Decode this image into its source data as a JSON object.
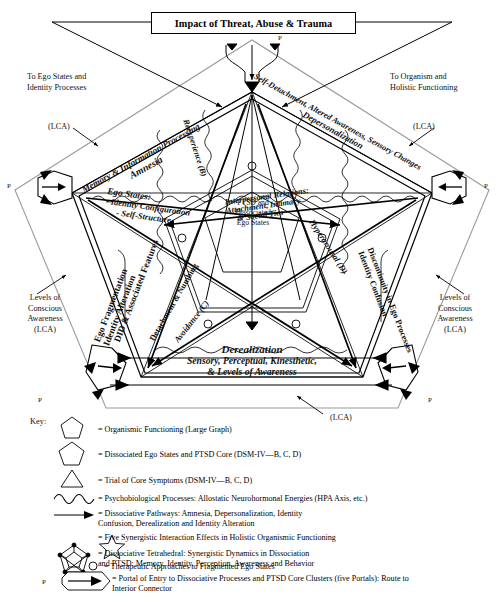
{
  "title": {
    "text": "Impact of Threat, Abuse & Trauma"
  },
  "annotations": {
    "left_top": "To Ego States and\nIdentity Processes",
    "right_top": "To Organism and\nHolistic Functioning",
    "lca_left_upper": "(LCA)",
    "lca_right_upper": "(LCA)",
    "lca_bottom": "(LCA)",
    "left_levels": "Levels of\nConscious\nAwareness\n(LCA)",
    "right_levels": "Levels of\nConscious\nAwareness\n(LCA)",
    "portal_letter": "P"
  },
  "center": {
    "line1": "PTSD and",
    "line2": "Dissociated",
    "line3": "Ego States"
  },
  "edges": [
    {
      "id": "upper-left",
      "line1": "Memory & Information Processing",
      "line2": "Amnesia"
    },
    {
      "id": "upper-right",
      "line1": "Self-Detachment, Altered Awareness, Sensory Changes",
      "line2": "Depersonalization"
    },
    {
      "id": "lower-left",
      "line1": "Ego Fragmentation",
      "line2": "Identity Alteration",
      "line3": "DID & Associated Features"
    },
    {
      "id": "lower-right",
      "line1": "Discontinuity in Ego Processes",
      "line2": "Identity Confusion"
    },
    {
      "id": "bottom",
      "line1": "Derealization",
      "line2": "Sensory, Perceptual, Kinesthetic,",
      "line3": "& Levels of Awareness"
    }
  ],
  "interior_labels": [
    {
      "id": "ego-states",
      "line1": "Ego States:",
      "line2": "- Identity Configuration",
      "line3": "- Self-Structure"
    },
    {
      "id": "interpersonal",
      "line1": "Interpersonal Relations:",
      "line2": "Attachment, Intimacy",
      "line3": "& Social Ties"
    }
  ],
  "spokes": [
    {
      "id": "reexperience",
      "label": "Reexperience (B)"
    },
    {
      "id": "detachment",
      "label": "Detachment & Numbing"
    },
    {
      "id": "avoidance",
      "label": "Avoidance (C)"
    },
    {
      "id": "hyperarousal",
      "label": "Hyperarousal (D)"
    }
  ],
  "key": {
    "label": "Key:",
    "items": [
      {
        "icon": "pentagon-small-icon",
        "text": "= Organismic Functioning (Large Graph)"
      },
      {
        "icon": "pentagon-icon",
        "text": "= Dissociated Ego States and PTSD Core (DSM-IV—B, C, D)"
      },
      {
        "icon": "triangle-icon",
        "text": "= Trial of Core Symptoms (DSM-IV—B, C, D)"
      },
      {
        "icon": "wave-icon",
        "text": "= Psychobiological Processes: Allostatic Neurohormonal Energies (HPA Axis, etc.)"
      },
      {
        "icon": "arrow-icon",
        "text": "= Dissociative Pathways: Amnesia, Depersonalization, Identity\n      Confusion, Derealization and Identity Alteration"
      },
      {
        "icon": "star-icon",
        "text": "= Five Synergistic Interaction Effects in Holistic Organismic Functioning"
      },
      {
        "icon": "tetrahedral-icon",
        "text": "= Dissociative Tetrahedral: Synergistic Dynamics in Dissociation\n      and PTSD: Memory, Identity, Perception, Awareness and Behavior"
      },
      {
        "icon": "circle-icon",
        "text": "= Therapeutic Approaches to Fragmented Ego States"
      },
      {
        "icon": "portal-icon",
        "text": "= Portal of Entry to Dissociative Processes and PTSD Core Clusters (five Portals): Route to\n      Interior Connector",
        "prefix": "P"
      }
    ]
  },
  "colors": {
    "ink": "#000000",
    "gray": "#8a8a8a",
    "paper": "#ffffff"
  }
}
